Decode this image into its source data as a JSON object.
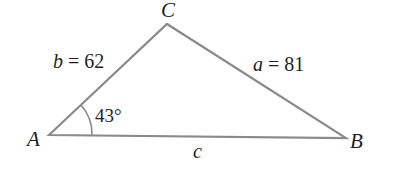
{
  "diagram": {
    "type": "triangle",
    "vertices": {
      "A": {
        "label": "A",
        "x": 49,
        "y": 135
      },
      "B": {
        "label": "B",
        "x": 346,
        "y": 138
      },
      "C": {
        "label": "C",
        "x": 167,
        "y": 24
      }
    },
    "sides": {
      "a": {
        "var": "a",
        "eq": " = ",
        "value": "81"
      },
      "b": {
        "var": "b",
        "eq": " = ",
        "value": "62"
      },
      "c": {
        "var": "c"
      }
    },
    "angle_A": {
      "label": "43°"
    },
    "colors": {
      "stroke": "#8a8a8a",
      "text": "#231f20"
    }
  }
}
